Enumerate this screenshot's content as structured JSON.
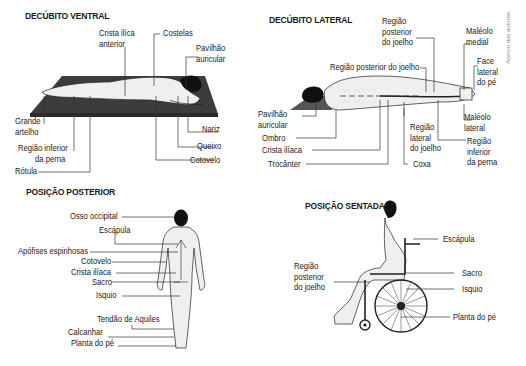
{
  "credit": "Acervo dos autores",
  "panels": {
    "ventral": {
      "title": "DECÚBITO VENTRAL",
      "labels": {
        "crista1": "Crista ilíca",
        "crista2": "anterior",
        "costelas": "Costelas",
        "pavilhao1": "Pavilhão",
        "pavilhao2": "auricular",
        "grande1": "Grande",
        "grande2": "artelho",
        "regiao1": "Região inferior",
        "regiao2": "da perna",
        "rotula": "Rótula",
        "nariz": "Nariz",
        "queixo": "Queixo",
        "cotovelo": "Cotovelo"
      }
    },
    "lateral": {
      "title": "DECÚBITO LATERAL",
      "labels": {
        "rpj_a1": "Região",
        "rpj_a2": "posterior",
        "rpj_a3": "do joelho",
        "rpj_b": "Região posterior do joelho",
        "maleolo_med1": "Maléolo",
        "maleolo_med2": "medial",
        "face1": "Face",
        "face2": "lateral",
        "face3": "do pé",
        "pav1": "Pavilhão",
        "pav2": "auricular",
        "ombro": "Ombro",
        "crista": "Crista ilíaca",
        "trocanter": "Trocânter",
        "rlj1": "Região",
        "rlj2": "lateral",
        "rlj3": "do joelho",
        "coxa": "Coxa",
        "maleolo_lat1": "Maléolo",
        "maleolo_lat2": "lateral",
        "rip1": "Região",
        "rip2": "inferior",
        "rip3": "da perna"
      }
    },
    "posterior": {
      "title": "POSIÇÃO POSTERIOR",
      "labels": {
        "occipital": "Osso occipital",
        "escapula": "Escápula",
        "apofises": "Apófises espinhosas",
        "cotovelo": "Cotovelo",
        "crista": "Crista ilíaca",
        "sacro": "Sacro",
        "isquio": "Isquio",
        "tendao": "Tendão de Aquiles",
        "calcanhar": "Calcanhar",
        "planta": "Planta do pé"
      }
    },
    "sentada": {
      "title": "POSIÇÃO SENTADA",
      "labels": {
        "escapula": "Escápula",
        "rpj1": "Região",
        "rpj2": "posterior",
        "rpj3": "do joelho",
        "sacro": "Sacro",
        "isquio": "Isquio",
        "planta": "Planta do pé"
      }
    }
  },
  "colors": {
    "mat": "#3c3c3c",
    "skin": "#efefef",
    "outline": "#222222",
    "hair": "#111111",
    "leader": "#333333"
  }
}
